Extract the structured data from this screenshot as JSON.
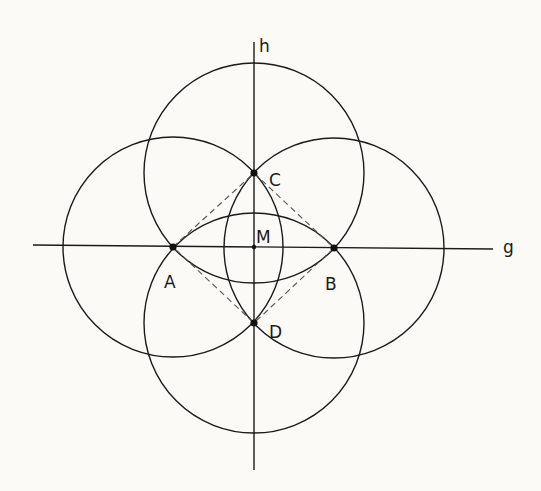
{
  "diagram": {
    "type": "geometric-construction",
    "colors": {
      "background": "#fbfaf6",
      "stroke": "#1a1a1a",
      "dashed": "#555555"
    },
    "lines": [
      {
        "id": "g",
        "label": "g",
        "x1": 33,
        "y1": 245,
        "x2": 493,
        "y2": 249
      },
      {
        "id": "h",
        "label": "h",
        "x1": 254,
        "y1": 42,
        "x2": 254,
        "y2": 470
      }
    ],
    "points": [
      {
        "id": "A",
        "label": "A",
        "x": 173,
        "y": 247,
        "lx": 164,
        "ly": 288
      },
      {
        "id": "B",
        "label": "B",
        "x": 334,
        "y": 248,
        "lx": 325,
        "ly": 290
      },
      {
        "id": "C",
        "label": "C",
        "x": 254,
        "y": 173,
        "lx": 269,
        "ly": 186
      },
      {
        "id": "D",
        "label": "D",
        "x": 254,
        "y": 323,
        "lx": 269,
        "ly": 338
      },
      {
        "id": "M",
        "label": "M",
        "x": 254,
        "y": 247,
        "lx": 256,
        "ly": 243
      }
    ],
    "circles": [
      {
        "center": "A",
        "r": 110
      },
      {
        "center": "B",
        "r": 110
      },
      {
        "center": "C",
        "r": 110
      },
      {
        "center": "D",
        "r": 110
      }
    ],
    "dashed_rhombus": [
      "A",
      "C",
      "B",
      "D"
    ],
    "axis_labels": {
      "g": "g",
      "h": "h"
    }
  }
}
